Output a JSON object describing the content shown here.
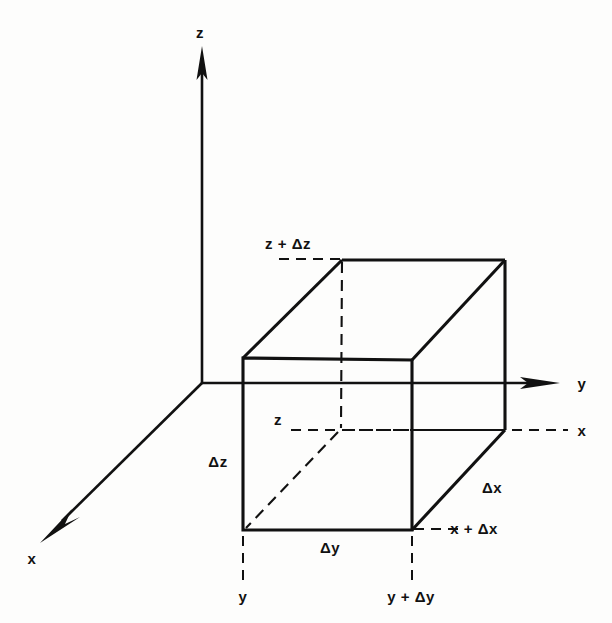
{
  "figure": {
    "type": "3d-axes-cube-diagram",
    "stroke_color": "#111111",
    "background_color": "#fdfdfc"
  },
  "axes": [
    {
      "name": "z-axis",
      "label": "z",
      "direction": "up",
      "label_x": 200,
      "label_y": 32
    },
    {
      "name": "y-axis",
      "label": "y",
      "direction": "right",
      "label_x": 582,
      "label_y": 383
    },
    {
      "name": "x-axis",
      "label": "x",
      "direction": "down-left",
      "label_x": 32,
      "label_y": 558
    }
  ],
  "dimension_labels": [
    {
      "name": "delta-z",
      "text": "Δz",
      "x": 218,
      "y": 461
    },
    {
      "name": "delta-y",
      "text": "Δy",
      "x": 330,
      "y": 547
    },
    {
      "name": "delta-x",
      "text": "Δx",
      "x": 492,
      "y": 487
    }
  ],
  "coordinate_labels": [
    {
      "name": "z-plus-delta-z",
      "text": "z + Δz",
      "x": 288,
      "y": 243
    },
    {
      "name": "z-lower",
      "text": "z",
      "x": 278,
      "y": 419
    },
    {
      "name": "x-dashed",
      "text": "x",
      "x": 582,
      "y": 430
    },
    {
      "name": "x-plus-delta-x",
      "text": "x + Δx",
      "x": 474,
      "y": 528
    },
    {
      "name": "y-front",
      "text": "y",
      "x": 243,
      "y": 596
    },
    {
      "name": "y-plus-delta-y",
      "text": "y + Δy",
      "x": 411,
      "y": 596
    }
  ],
  "geometry": {
    "origin": {
      "x": 202,
      "y": 383
    },
    "cube_vertices": {
      "front_top_left": {
        "x": 243,
        "y": 358
      },
      "front_top_right": {
        "x": 412,
        "y": 360
      },
      "front_bottom_left": {
        "x": 243,
        "y": 530
      },
      "front_bottom_right": {
        "x": 412,
        "y": 530
      },
      "back_top_left": {
        "x": 342,
        "y": 260
      },
      "back_top_right": {
        "x": 505,
        "y": 260
      },
      "back_bottom_right": {
        "x": 505,
        "y": 430
      },
      "back_bottom_left_hidden": {
        "x": 340,
        "y": 430
      }
    }
  }
}
